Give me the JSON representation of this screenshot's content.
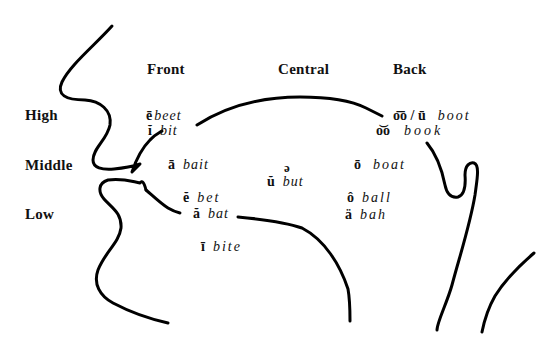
{
  "diagram": {
    "type": "vowel-chart-mouth-profile",
    "columns": [
      {
        "label": "Front",
        "x": 147,
        "y": 61
      },
      {
        "label": "Central",
        "x": 278,
        "y": 61
      },
      {
        "label": "Back",
        "x": 393,
        "y": 61
      }
    ],
    "rows": [
      {
        "label": "High",
        "x": 25,
        "y": 107
      },
      {
        "label": "Middle",
        "x": 25,
        "y": 157
      },
      {
        "label": "Low",
        "x": 25,
        "y": 206
      }
    ],
    "vowels": [
      {
        "symbol": "ē",
        "word": "beet",
        "x": 146,
        "y": 108
      },
      {
        "symbol": "ĭ",
        "word": "bit",
        "x": 148,
        "y": 123
      },
      {
        "symbol": "ā",
        "word": "bait",
        "x": 168,
        "y": 157
      },
      {
        "symbol": "ŭ",
        "word": "but",
        "x": 267,
        "y": 174
      },
      {
        "symbol": "ō",
        "word": "boat",
        "x": 354,
        "y": 157
      },
      {
        "symbol": "o͞o / ū",
        "word": "boot",
        "x": 393,
        "y": 108
      },
      {
        "symbol": "o͝o",
        "word": "book",
        "x": 376,
        "y": 123
      },
      {
        "symbol": "ĕ",
        "word": "bet",
        "x": 183,
        "y": 190
      },
      {
        "symbol": "ă",
        "word": "bat",
        "x": 193,
        "y": 206
      },
      {
        "symbol": "ô",
        "word": "ball",
        "x": 347,
        "y": 190
      },
      {
        "symbol": "ä",
        "word": "bah",
        "x": 345,
        "y": 207
      },
      {
        "symbol": "ī",
        "word": "bite",
        "x": 201,
        "y": 239
      }
    ],
    "schwa": {
      "symbol": "ə",
      "x": 284,
      "y": 160
    },
    "stroke_color": "#000000",
    "text_color": "#111111",
    "background": "#ffffff"
  }
}
